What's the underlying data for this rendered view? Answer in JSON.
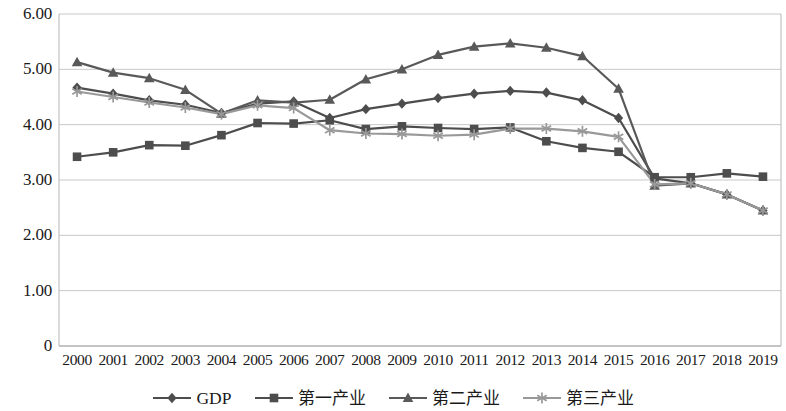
{
  "chart_data": {
    "type": "line",
    "title": "",
    "xlabel": "",
    "ylabel": "",
    "x": [
      "2000",
      "2001",
      "2002",
      "2003",
      "2004",
      "2005",
      "2006",
      "2007",
      "2008",
      "2009",
      "2010",
      "2011",
      "2012",
      "2013",
      "2014",
      "2015",
      "2016",
      "2017",
      "2018",
      "2019"
    ],
    "categories": [
      "2000",
      "2001",
      "2002",
      "2003",
      "2004",
      "2005",
      "2006",
      "2007",
      "2008",
      "2009",
      "2010",
      "2011",
      "2012",
      "2013",
      "2014",
      "2015",
      "2016",
      "2017",
      "2018",
      "2019"
    ],
    "ylim": [
      0,
      6
    ],
    "ytick_labels": [
      "0",
      "1.00",
      "2.00",
      "3.00",
      "4.00",
      "5.00",
      "6.00"
    ],
    "ytick_values": [
      0,
      1,
      2,
      3,
      4,
      5,
      6
    ],
    "grid": true,
    "legend_position": "bottom",
    "series": [
      {
        "name": "GDP",
        "marker": "diamond",
        "color": "#4d4d4d",
        "values": [
          4.67,
          4.56,
          4.44,
          4.36,
          4.21,
          4.38,
          4.42,
          4.12,
          4.28,
          4.38,
          4.48,
          4.56,
          4.61,
          4.58,
          4.44,
          4.12,
          3.03,
          2.94,
          2.74,
          2.45
        ]
      },
      {
        "name": "第一产业",
        "marker": "square",
        "color": "#4d4d4d",
        "values": [
          3.42,
          3.5,
          3.63,
          3.62,
          3.81,
          4.03,
          4.02,
          4.08,
          3.92,
          3.97,
          3.94,
          3.92,
          3.95,
          3.7,
          3.58,
          3.51,
          3.05,
          3.05,
          3.12,
          3.06
        ]
      },
      {
        "name": "第二产业",
        "marker": "triangle",
        "color": "#595959",
        "values": [
          5.13,
          4.94,
          4.84,
          4.63,
          4.2,
          4.44,
          4.4,
          4.45,
          4.82,
          5.0,
          5.26,
          5.41,
          5.47,
          5.39,
          5.24,
          4.65,
          2.9,
          2.94,
          2.74,
          2.45
        ]
      },
      {
        "name": "第三产业",
        "marker": "star",
        "color": "#999999",
        "values": [
          4.6,
          4.5,
          4.4,
          4.31,
          4.19,
          4.35,
          4.3,
          3.9,
          3.84,
          3.83,
          3.8,
          3.82,
          3.93,
          3.93,
          3.88,
          3.78,
          2.92,
          2.94,
          2.74,
          2.45
        ]
      }
    ]
  },
  "legend": {
    "items": [
      {
        "label": "GDP"
      },
      {
        "label": "第一产业"
      },
      {
        "label": "第二产业"
      },
      {
        "label": "第三产业"
      }
    ]
  }
}
